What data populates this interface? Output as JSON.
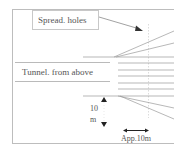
{
  "diagram": {
    "type": "tunnel-blast-hole-plan",
    "labels": {
      "spread_holes": "Spread. holes",
      "tunnel": "Tunnel. from above",
      "vertical_dimension_value": "10",
      "vertical_dimension_unit": "m",
      "horizontal_dimension": "App.10m"
    },
    "colors": {
      "line": "#9a9a9a",
      "frame": "#b8b8b8",
      "text": "#555555",
      "arrow": "#333333"
    }
  }
}
